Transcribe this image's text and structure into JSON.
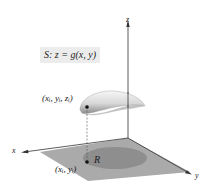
{
  "diagram": {
    "surface_label": "S: z = g(x, y)",
    "point_3d_label": "(xᵢ, yᵢ, zᵢ)",
    "point_2d_label": "(xᵢ, yᵢ)",
    "region_label": "R",
    "axes": {
      "x": "x",
      "y": "y",
      "z": "z"
    },
    "colors": {
      "plane": "#a9a9a9",
      "region": "#8c8c8c",
      "surface_light": "#f4f4f4",
      "surface_dark": "#9a9a9a",
      "axes": "#333333",
      "label_box": "#ececec"
    }
  }
}
